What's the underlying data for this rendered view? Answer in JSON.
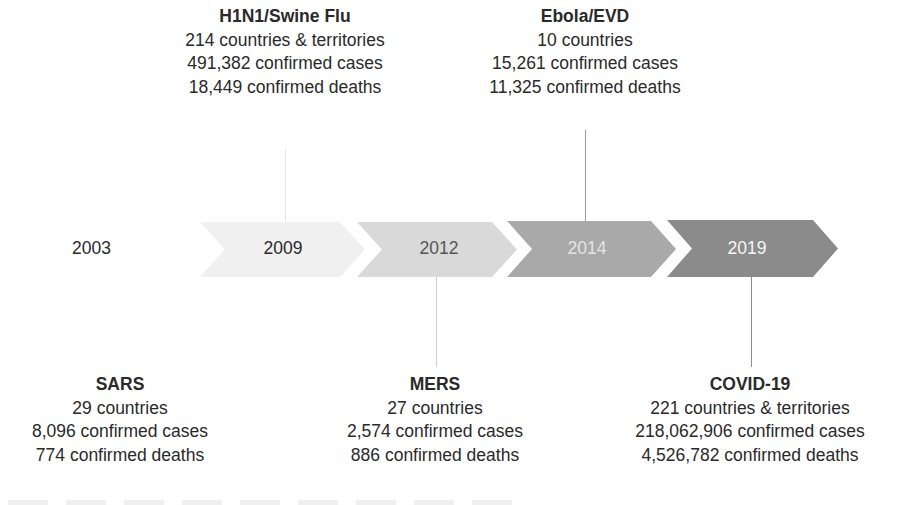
{
  "timeline": {
    "start_year": "2003",
    "chevrons": [
      {
        "year": "2009",
        "fill": "#f0f0f0"
      },
      {
        "year": "2012",
        "fill": "#d9d9d9"
      },
      {
        "year": "2014",
        "fill": "#a9a9a9"
      },
      {
        "year": "2019",
        "fill": "#8b8b8b"
      }
    ]
  },
  "events": {
    "h1n1": {
      "title": "H1N1/Swine Flu",
      "countries": "214 countries & territories",
      "cases": "491,382 confirmed cases",
      "deaths": "18,449 confirmed deaths",
      "position": "above",
      "year": "2009"
    },
    "ebola": {
      "title": "Ebola/EVD",
      "countries": "10 countries",
      "cases": "15,261 confirmed cases",
      "deaths": "11,325 confirmed deaths",
      "position": "above",
      "year": "2014"
    },
    "sars": {
      "title": "SARS",
      "countries": "29 countries",
      "cases": "8,096 confirmed cases",
      "deaths": "774 confirmed deaths",
      "position": "below",
      "year": "2003"
    },
    "mers": {
      "title": "MERS",
      "countries": "27 countries",
      "cases": "2,574 confirmed cases",
      "deaths": "886 confirmed deaths",
      "position": "below",
      "year": "2012"
    },
    "covid": {
      "title": "COVID-19",
      "countries": "221 countries & territories",
      "cases": "218,062,906 confirmed cases",
      "deaths": "4,526,782 confirmed deaths",
      "position": "below",
      "year": "2019"
    }
  }
}
